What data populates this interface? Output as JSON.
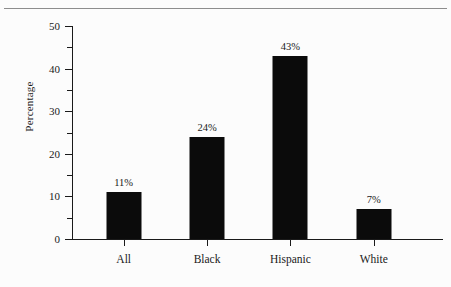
{
  "chart_data": {
    "type": "bar",
    "title": "",
    "subtitle": "",
    "xlabel": "",
    "ylabel": "Percentage",
    "categories": [
      "All",
      "Black",
      "Hispanic",
      "White"
    ],
    "values": [
      11,
      24,
      43,
      7
    ],
    "data_labels": [
      "11%",
      "24%",
      "43%",
      "7%"
    ],
    "ylim": [
      0,
      50
    ],
    "y_major_ticks": [
      0,
      10,
      20,
      30,
      40,
      50
    ],
    "y_major_tick_labels": [
      "0",
      "10",
      "20",
      "30",
      "40",
      "50"
    ],
    "y_minor_ticks": [
      5,
      15,
      25,
      35,
      45
    ],
    "grid": false,
    "legend": false,
    "legend_position": "none",
    "bar_color": "#0b0b0b",
    "axis_color": "#1a1a1a",
    "background_color": "#fcfcfc"
  }
}
